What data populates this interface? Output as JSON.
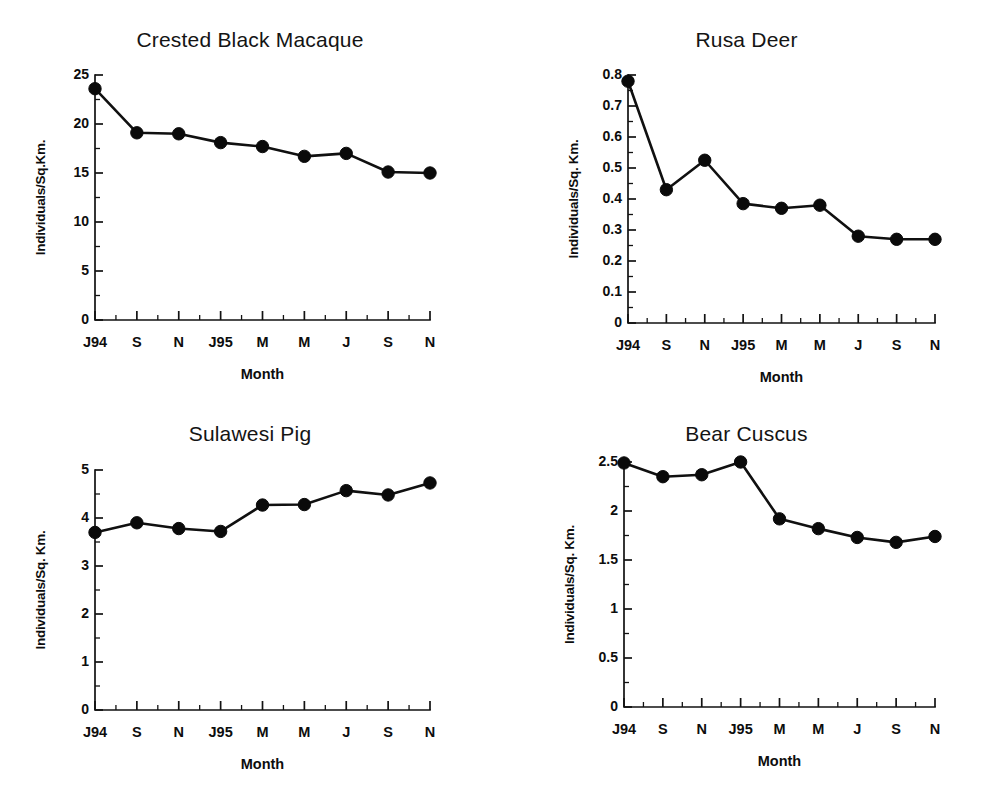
{
  "figure": {
    "background": "#ffffff",
    "ink_color": "#101010",
    "panel_count": 4,
    "shared_xlabel": "Month",
    "shared_x_ticks": [
      "J94",
      "S",
      "N",
      "J95",
      "M",
      "M",
      "J",
      "S",
      "N"
    ]
  },
  "chart_data": [
    {
      "type": "line",
      "title": "Crested Black Macaque",
      "xlabel": "Month",
      "ylabel": "Individuals/Sq.Km.",
      "categories": [
        "J94",
        "S",
        "N",
        "J95",
        "M",
        "M",
        "J",
        "S",
        "N"
      ],
      "values": [
        23.6,
        19.1,
        19.0,
        18.1,
        17.7,
        16.7,
        17.0,
        15.1,
        15.0
      ],
      "ylim": [
        0,
        25
      ],
      "ytick_values": [
        0,
        5,
        10,
        15,
        20,
        25
      ],
      "ytick_labels": [
        "0",
        "5",
        "10",
        "15",
        "20",
        "25"
      ],
      "yminor_step": 2.5,
      "grid": false,
      "legend": "none",
      "marker": "filled-circle"
    },
    {
      "type": "line",
      "title": "Rusa Deer",
      "xlabel": "Month",
      "ylabel": "Individuals/Sq. Km.",
      "categories": [
        "J94",
        "S",
        "N",
        "J95",
        "M",
        "M",
        "J",
        "S",
        "N"
      ],
      "values": [
        0.78,
        0.43,
        0.525,
        0.385,
        0.37,
        0.38,
        0.28,
        0.27,
        0.27
      ],
      "ylim": [
        0,
        0.8
      ],
      "ytick_values": [
        0,
        0.1,
        0.2,
        0.3,
        0.4,
        0.5,
        0.6,
        0.7,
        0.8
      ],
      "ytick_labels": [
        "0",
        "0.1",
        "0.2",
        "0.3",
        "0.4",
        "0.5",
        "0.6",
        "0.7",
        "0.8"
      ],
      "yminor_step": 0.05,
      "grid": false,
      "legend": "none",
      "marker": "filled-circle"
    },
    {
      "type": "line",
      "title": "Sulawesi Pig",
      "xlabel": "Month",
      "ylabel": "Individuals/Sq. Km.",
      "categories": [
        "J94",
        "S",
        "N",
        "J95",
        "M",
        "M",
        "J",
        "S",
        "N"
      ],
      "values": [
        3.7,
        3.9,
        3.78,
        3.72,
        4.27,
        4.28,
        4.57,
        4.48,
        4.73
      ],
      "ylim": [
        0,
        5
      ],
      "ytick_values": [
        0,
        1,
        2,
        3,
        4,
        5
      ],
      "ytick_labels": [
        "0",
        "1",
        "2",
        "3",
        "4",
        "5"
      ],
      "yminor_step": 0.5,
      "grid": false,
      "legend": "none",
      "marker": "filled-circle"
    },
    {
      "type": "line",
      "title": "Bear Cuscus",
      "xlabel": "Month",
      "ylabel": "Individuals/Sq. Km.",
      "categories": [
        "J94",
        "S",
        "N",
        "J95",
        "M",
        "M",
        "J",
        "S",
        "N"
      ],
      "values": [
        2.49,
        2.35,
        2.37,
        2.5,
        1.92,
        1.82,
        1.73,
        1.68,
        1.74
      ],
      "ylim": [
        0,
        2.5
      ],
      "ytick_values": [
        0,
        0.5,
        1,
        1.5,
        2,
        2.5
      ],
      "ytick_labels": [
        "0",
        "0.5",
        "1",
        "1.5",
        "2",
        "2.5"
      ],
      "yminor_step": 0.25,
      "grid": false,
      "legend": "none",
      "marker": "filled-circle"
    }
  ],
  "panels": [
    {
      "id": "crested-black-macaque",
      "title_top": 28,
      "plot": {
        "left": 95,
        "top": 75,
        "width": 335,
        "height": 245
      }
    },
    {
      "id": "rusa-deer",
      "title_top": 28,
      "plot": {
        "left": 128,
        "top": 75,
        "width": 307,
        "height": 248
      }
    },
    {
      "id": "sulawesi-pig",
      "title_top": 22,
      "plot": {
        "left": 95,
        "top": 70,
        "width": 335,
        "height": 240
      }
    },
    {
      "id": "bear-cuscus",
      "title_top": 22,
      "plot": {
        "left": 124,
        "top": 62,
        "width": 311,
        "height": 245
      }
    }
  ]
}
